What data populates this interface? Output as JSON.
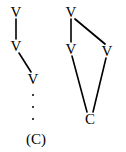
{
  "figure": {
    "background_color": "#ffffff",
    "ink_color": "#000000",
    "width": 126,
    "height": 152,
    "graphs": [
      {
        "id": "left-graph",
        "name": "path-chain-graph",
        "nodes": [
          {
            "id": "l1",
            "label": "V",
            "x": 16,
            "y": 12
          },
          {
            "id": "l2",
            "label": "V",
            "x": 16,
            "y": 46
          },
          {
            "id": "l3",
            "label": "V",
            "x": 33,
            "y": 79
          }
        ],
        "edges": [
          {
            "from": "l1",
            "to": "l2",
            "x1": 16,
            "y1": 19,
            "x2": 16,
            "y2": 39
          },
          {
            "from": "l2",
            "to": "l3",
            "x1": 19,
            "y1": 53,
            "x2": 31,
            "y2": 72
          }
        ],
        "ellipsis": {
          "x": 33,
          "y": 107,
          "dots": 3
        },
        "caption": {
          "label": "(C)",
          "x": 36,
          "y": 139
        }
      },
      {
        "id": "right-graph",
        "name": "diamond-graph",
        "nodes": [
          {
            "id": "r1",
            "label": "V",
            "x": 71,
            "y": 12
          },
          {
            "id": "r2",
            "label": "V",
            "x": 71,
            "y": 49
          },
          {
            "id": "r3",
            "label": "V",
            "x": 107,
            "y": 51
          },
          {
            "id": "r4",
            "label": "C",
            "x": 90,
            "y": 119
          }
        ],
        "edges": [
          {
            "from": "r1",
            "to": "r2",
            "x1": 71,
            "y1": 19,
            "x2": 71,
            "y2": 42
          },
          {
            "from": "r1",
            "to": "r3",
            "x1": 75,
            "y1": 19,
            "x2": 105,
            "y2": 44
          },
          {
            "from": "r2",
            "to": "r4",
            "x1": 72,
            "y1": 56,
            "x2": 87,
            "y2": 112
          },
          {
            "from": "r3",
            "to": "r4",
            "x1": 106,
            "y1": 58,
            "x2": 93,
            "y2": 112
          }
        ]
      }
    ]
  }
}
